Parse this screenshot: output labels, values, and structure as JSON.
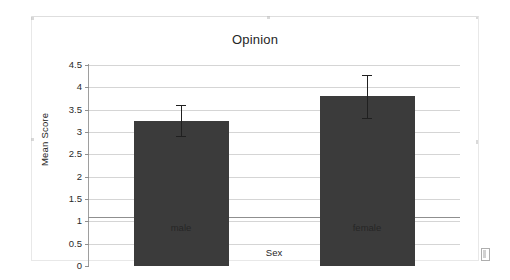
{
  "chart_data": {
    "type": "bar",
    "title": "Opinion",
    "xlabel": "Sex",
    "ylabel": "Mean Score",
    "categories": [
      "male",
      "female"
    ],
    "values": [
      3.25,
      3.8
    ],
    "errors": [
      0.35,
      0.48
    ],
    "series": [
      {
        "name": "Mean Score",
        "values": [
          3.25,
          3.8
        ]
      }
    ],
    "ylim": [
      0,
      4.5
    ],
    "ytick_labels": [
      "0",
      "0.5",
      "1",
      "1.5",
      "2",
      "2.5",
      "3",
      "3.5",
      "4",
      "4.5"
    ],
    "ytick_values": [
      0,
      0.5,
      1,
      1.5,
      2,
      2.5,
      3,
      3.5,
      4,
      4.5
    ],
    "grid": true,
    "legend": "none",
    "bar_color": "#3b3b3b",
    "gridline_color": "#d5d5d5",
    "axis_color": "#8f8f8f",
    "error_bar_color": "#202020"
  },
  "page": {
    "background": "#ffffff",
    "frame_color": "#e8e8e8"
  }
}
